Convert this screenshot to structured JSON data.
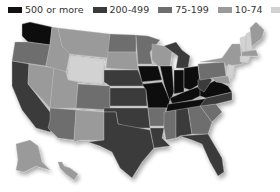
{
  "legend": {
    "items": [
      {
        "label": "500 or more",
        "color": "#111111"
      },
      {
        "label": "200-499",
        "color": "#3a3a3a"
      },
      {
        "label": "75-199",
        "color": "#6e6e6e"
      },
      {
        "label": "10-74",
        "color": "#9a9a9a"
      },
      {
        "label": "0-9",
        "color": "#d2d2d2"
      }
    ]
  },
  "map": {
    "title": "",
    "region": "United States",
    "categories": [
      "500 or more",
      "200-499",
      "75-199",
      "10-74",
      "0-9"
    ]
  }
}
